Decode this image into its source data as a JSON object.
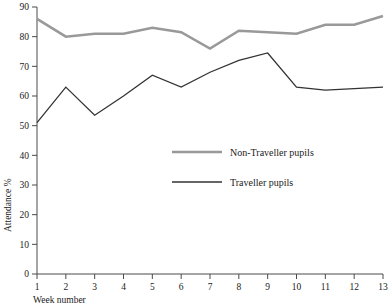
{
  "chart_data": {
    "type": "line",
    "title": "",
    "xlabel": "Week number",
    "ylabel": "Attendance %",
    "x": [
      1,
      2,
      3,
      4,
      5,
      6,
      7,
      8,
      9,
      10,
      11,
      12,
      13
    ],
    "xticklabels": [
      "1",
      "2",
      "3",
      "4",
      "5",
      "6",
      "7",
      "8",
      "9",
      "10",
      "11",
      "12",
      "13"
    ],
    "yticklabels": [
      "0",
      "10",
      "20",
      "30",
      "40",
      "50",
      "60",
      "70",
      "80",
      "90"
    ],
    "yticks": [
      0,
      10,
      20,
      30,
      40,
      50,
      60,
      70,
      80,
      90
    ],
    "xlim": [
      1,
      13
    ],
    "ylim": [
      0,
      90
    ],
    "grid": false,
    "legend_position": "center-right",
    "series": [
      {
        "name": "Non-Traveller pupils",
        "color": "#999999",
        "linewidth": 2.6,
        "values": [
          86,
          80,
          81,
          81,
          83,
          81.5,
          76,
          82,
          81.5,
          81,
          84,
          84,
          87
        ]
      },
      {
        "name": "Traveller pupils",
        "color": "#333333",
        "linewidth": 1.3,
        "values": [
          51,
          63,
          53.5,
          60,
          67,
          63,
          68,
          72,
          74.5,
          63,
          62,
          62.5,
          63
        ]
      }
    ]
  },
  "legend": {
    "items": [
      {
        "label": "Non-Traveller pupils"
      },
      {
        "label": "Traveller pupils"
      }
    ]
  },
  "axes": {
    "x_title": "Week number",
    "y_title": "Attendance %"
  }
}
